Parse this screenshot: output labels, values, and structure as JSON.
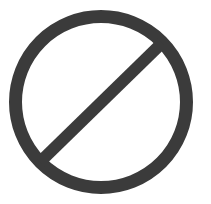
{
  "symbol": {
    "name": "prohibited",
    "label": "No / Prohibited symbol",
    "colors": {
      "stroke": "#3b3b3b",
      "background": "#ffffff"
    },
    "circle": {
      "cx": 101,
      "cy": 102,
      "r": 85.5,
      "stroke_width": 13
    },
    "slash": {
      "x1": 40,
      "y1": 162,
      "x2": 162,
      "y2": 43,
      "stroke_width": 12
    }
  }
}
